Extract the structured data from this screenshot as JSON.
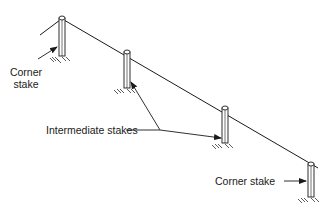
{
  "diagram": {
    "labels": {
      "corner_stake_top": [
        "Corner",
        "stake"
      ],
      "intermediate_stakes": "Intermediate stakes",
      "corner_stake_bottom": "Corner stake"
    },
    "stakes": [
      {
        "name": "corner-stake-left",
        "type": "corner"
      },
      {
        "name": "intermediate-stake-1",
        "type": "intermediate"
      },
      {
        "name": "intermediate-stake-2",
        "type": "intermediate"
      },
      {
        "name": "corner-stake-right",
        "type": "corner"
      }
    ],
    "colors": {
      "line": "#1a1a1a",
      "background": "#ffffff"
    }
  }
}
